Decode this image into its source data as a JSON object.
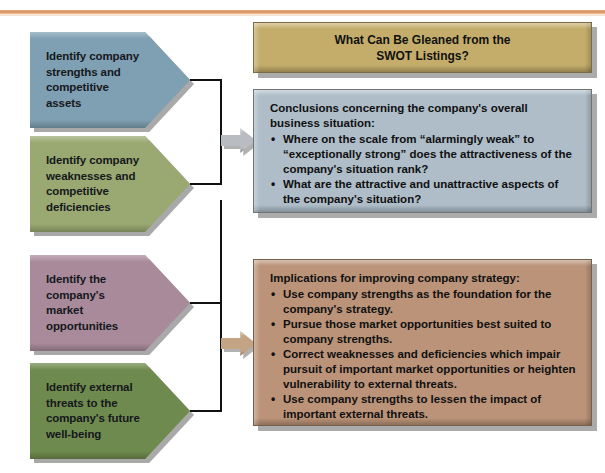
{
  "figure": {
    "title_box": {
      "line1": "What Can Be Gleaned from the",
      "line2": "SWOT Listings?",
      "color": "#c4ad6a"
    },
    "steps": [
      {
        "id": "strengths",
        "label": "Identify company strengths and competitive assets",
        "color": "#7f9fb2"
      },
      {
        "id": "weaknesses",
        "label": "Identify company weaknesses and competitive deficiencies",
        "color": "#9aa871"
      },
      {
        "id": "opportunities",
        "label": "Identify the company's market opportunities",
        "color": "#a98a9a"
      },
      {
        "id": "threats",
        "label": "Identify external threats to the company's future well-being",
        "color": "#6f8a4e"
      }
    ],
    "conclusions_box": {
      "heading": "Conclusions concerning the company's overall business situation:",
      "color": "#aebdc8",
      "bullets": [
        "Where on the scale from “alarmingly weak” to “exceptionally strong” does the attractiveness of the company's situation rank?",
        "What are the attractive and unattractive aspects of the company's situation?"
      ]
    },
    "implications_box": {
      "heading": "Implications for improving company strategy:",
      "color": "#bb9378",
      "bullets": [
        "Use company strengths as the foundation for the company's strategy.",
        "Pursue those market opportunities best suited to company strengths.",
        "Correct weaknesses and deficiencies which impair pursuit of important market opportunities or heighten vulnerability to external threats.",
        "Use company strengths to lessen the impact of important external threats."
      ]
    },
    "connectors": [
      {
        "id": "upper",
        "arrow_color": "#b9bcc0"
      },
      {
        "id": "lower",
        "arrow_color": "#c3a585"
      }
    ],
    "bullet_glyph": "•",
    "top_rule_color": "#d98f5c"
  }
}
